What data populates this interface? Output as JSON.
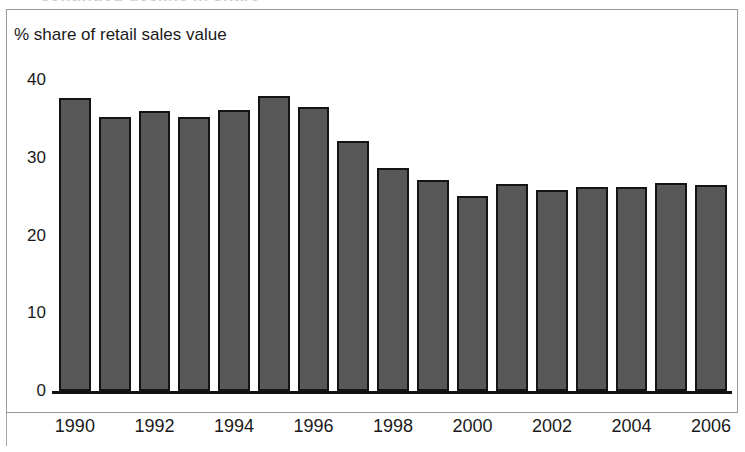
{
  "chart_data": {
    "type": "bar",
    "title": "",
    "subtitle": "",
    "axis_caption": "% share of retail sales value",
    "xlabel": "",
    "ylabel": "% share of retail sales value",
    "categories": [
      "1990",
      "1991",
      "1992",
      "1993",
      "1994",
      "1995",
      "1996",
      "1997",
      "1998",
      "1999",
      "2000",
      "2001",
      "2002",
      "2003",
      "2004",
      "2005",
      "2006"
    ],
    "values": [
      37.7,
      35.2,
      36.0,
      35.2,
      36.2,
      37.9,
      36.5,
      32.2,
      28.7,
      27.1,
      25.1,
      26.6,
      25.8,
      26.2,
      26.2,
      26.8,
      26.5
    ],
    "x_tick_labels": [
      "1990",
      "1992",
      "1994",
      "1996",
      "1998",
      "2000",
      "2002",
      "2004",
      "2006"
    ],
    "x_tick_category_indices": [
      0,
      2,
      4,
      6,
      8,
      10,
      12,
      14,
      16
    ],
    "y_tick_labels": [
      "0",
      "10",
      "20",
      "30",
      "40"
    ],
    "y_tick_values": [
      0,
      10,
      20,
      30,
      40
    ],
    "ylim": [
      0,
      40
    ],
    "grid": false,
    "legend": null,
    "legend_position": "none",
    "bar_fill_color": "#585858",
    "bar_border_color": "#141414",
    "frame_color": "#9a9a9a",
    "axis_color": "#111111",
    "text_color": "#1a1a1a",
    "clipped_heading_fragment": "continued decline in share"
  }
}
